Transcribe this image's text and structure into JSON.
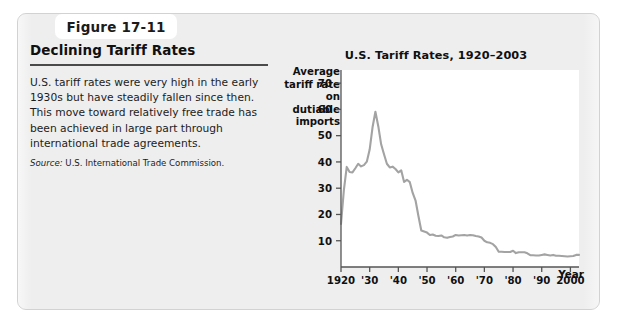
{
  "figure": {
    "tab_label": "Figure 17-11",
    "heading": "Declining Tariff Rates",
    "body": "U.S. tariff rates were very high in the early 1930s but have steadily fallen since then. This move toward relatively free trade has been achieved in large part through international trade agreements.",
    "source_label": "Source:",
    "source_text": " U.S. International Trade Commission."
  },
  "chart_data": {
    "type": "line",
    "title": "U.S. Tariff Rates, 1920–2003",
    "ylabel": "Average tariff rate on dutiable imports",
    "xlabel": "Year",
    "xlim": [
      1920,
      2003
    ],
    "ylim": [
      0,
      75
    ],
    "grid": false,
    "legend": "none",
    "line_color": "#a3a3a3",
    "y_ticks": [
      10,
      20,
      30,
      40,
      50,
      60,
      70
    ],
    "y_tick_labels": [
      "10",
      "20",
      "30",
      "40",
      "50",
      "60",
      "70"
    ],
    "x_ticks": [
      1920,
      1930,
      1940,
      1950,
      1960,
      1970,
      1980,
      1990,
      2000
    ],
    "x_tick_labels": [
      "1920",
      "'30",
      "'40",
      "'50",
      "'60",
      "'70",
      "'80",
      "'90",
      "2000"
    ],
    "series": [
      {
        "name": "Average tariff rate on dutiable imports",
        "x": [
          1920,
          1921,
          1922,
          1923,
          1924,
          1925,
          1926,
          1927,
          1928,
          1929,
          1930,
          1931,
          1932,
          1933,
          1934,
          1935,
          1936,
          1937,
          1938,
          1939,
          1940,
          1941,
          1942,
          1943,
          1944,
          1945,
          1946,
          1947,
          1948,
          1949,
          1950,
          1951,
          1952,
          1953,
          1954,
          1955,
          1956,
          1957,
          1958,
          1959,
          1960,
          1961,
          1962,
          1963,
          1964,
          1965,
          1966,
          1967,
          1968,
          1969,
          1970,
          1971,
          1972,
          1973,
          1974,
          1975,
          1976,
          1977,
          1978,
          1979,
          1980,
          1981,
          1982,
          1983,
          1984,
          1985,
          1986,
          1987,
          1988,
          1989,
          1990,
          1991,
          1992,
          1993,
          1994,
          1995,
          1996,
          1997,
          1998,
          1999,
          2000,
          2001,
          2002,
          2003
        ],
        "y": [
          16.4,
          29.3,
          38.1,
          36.2,
          36.0,
          37.6,
          39.3,
          38.3,
          38.8,
          40.1,
          44.7,
          53.2,
          59.1,
          53.6,
          46.7,
          42.9,
          39.3,
          37.9,
          38.2,
          37.3,
          36.0,
          36.8,
          32.4,
          33.2,
          32.3,
          28.2,
          25.3,
          19.4,
          13.9,
          13.5,
          13.1,
          12.2,
          12.4,
          11.9,
          11.8,
          12.0,
          11.3,
          11.1,
          11.4,
          11.6,
          12.2,
          12.0,
          12.1,
          12.2,
          12.0,
          12.2,
          12.1,
          11.8,
          11.6,
          11.2,
          10.0,
          9.4,
          9.2,
          8.7,
          7.6,
          5.8,
          5.8,
          5.7,
          5.7,
          5.7,
          6.2,
          5.3,
          5.6,
          5.6,
          5.6,
          5.2,
          4.5,
          4.5,
          4.4,
          4.4,
          4.6,
          4.8,
          4.6,
          4.4,
          4.6,
          4.3,
          4.3,
          4.2,
          4.1,
          4.0,
          4.1,
          4.2,
          4.6,
          4.6
        ]
      }
    ]
  }
}
